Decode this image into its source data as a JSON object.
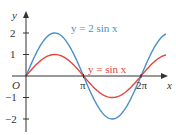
{
  "chart_data": {
    "type": "line",
    "title": "",
    "xlabel": "x",
    "ylabel": "y",
    "origin_label": "O",
    "x_ticks": [
      {
        "value": 3.14159,
        "label": "π"
      },
      {
        "value": 6.28318,
        "label": "2π"
      }
    ],
    "y_ticks": [
      {
        "value": 2,
        "label": "2"
      },
      {
        "value": 1,
        "label": "1"
      },
      {
        "value": -1,
        "label": "−1"
      },
      {
        "value": -2,
        "label": "−2"
      }
    ],
    "xlim": [
      0,
      7.6
    ],
    "ylim": [
      -2.6,
      3
    ],
    "grid": false,
    "series": [
      {
        "name": "y = 2 sin x",
        "label": "y = 2 sin x",
        "color": "#4a8fc9",
        "amplitude": 2,
        "function": "2*sin(x)"
      },
      {
        "name": "y = sin x",
        "label": "y = sin x",
        "color": "#e2453b",
        "amplitude": 1,
        "function": "sin(x)"
      }
    ]
  },
  "labels": {
    "series_blue": "y = 2 sin x",
    "series_red": "y = sin x",
    "x_axis": "x",
    "y_axis": "y",
    "origin": "O",
    "pi": "π",
    "two_pi": "2π",
    "y2": "2",
    "y1": "1",
    "ym1": "−1",
    "ym2": "−2"
  }
}
